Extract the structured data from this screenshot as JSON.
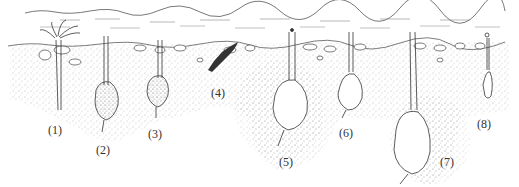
{
  "figure": {
    "colors": {
      "ink": "#333333",
      "stipple": "#8a8a8a",
      "background": "#ffffff"
    },
    "specimens": [
      {
        "id": 1,
        "label": "(1)",
        "x": 48,
        "y": 124
      },
      {
        "id": 2,
        "label": "(2)",
        "x": 96,
        "y": 144
      },
      {
        "id": 3,
        "label": "(3)",
        "x": 148,
        "y": 128
      },
      {
        "id": 4,
        "label": "(4)",
        "x": 211,
        "y": 87
      },
      {
        "id": 5,
        "label": "(5)",
        "x": 279,
        "y": 156
      },
      {
        "id": 6,
        "label": "(6)",
        "x": 339,
        "y": 127
      },
      {
        "id": 7,
        "label": "(7)",
        "x": 440,
        "y": 156
      },
      {
        "id": 8,
        "label": "(8)",
        "x": 477,
        "y": 118
      }
    ]
  }
}
